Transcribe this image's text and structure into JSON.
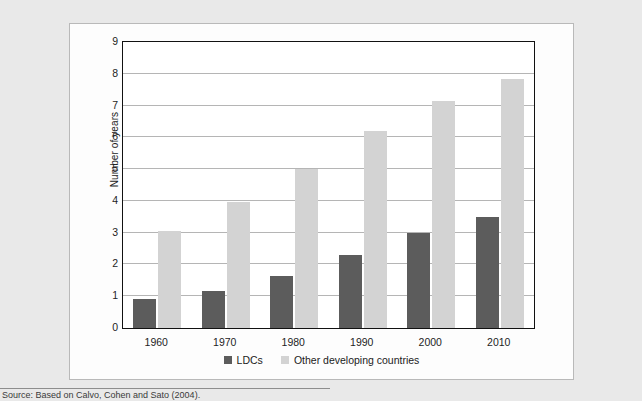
{
  "figure": {
    "source_note": "Source:  Based on Calvo, Cohen and Sato (2004).",
    "background_color": "#e9e9e9",
    "panel_color": "#fdfdfd",
    "panel_border_color": "#b9b9b9"
  },
  "chart_data": {
    "type": "bar",
    "title": "",
    "xlabel": "",
    "ylabel": "Number of years",
    "categories": [
      "1960",
      "1970",
      "1980",
      "1990",
      "2000",
      "2010"
    ],
    "series": [
      {
        "name": "LDCs",
        "color": "#5c5c5c",
        "values": [
          0.9,
          1.15,
          1.65,
          2.3,
          3.0,
          3.5
        ]
      },
      {
        "name": "Other developing countries",
        "color": "#d3d3d3",
        "values": [
          3.05,
          3.95,
          5.0,
          6.2,
          7.15,
          7.85
        ]
      }
    ],
    "ylim": [
      0,
      9
    ],
    "ytick_values": [
      0,
      1,
      2,
      3,
      4,
      5,
      6,
      7,
      8,
      9
    ],
    "ytick_labels": [
      "0",
      "1",
      "2",
      "3",
      "4",
      "5",
      "6",
      "7",
      "8",
      "9"
    ],
    "grid": "horizontal",
    "legend_position": "bottom-center"
  }
}
